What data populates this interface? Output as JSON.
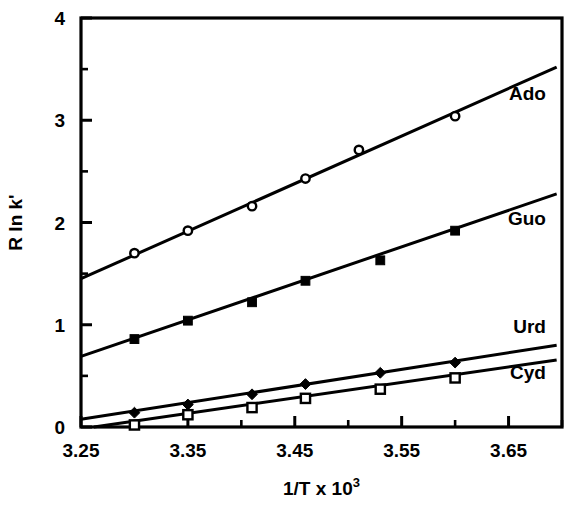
{
  "chart_data": {
    "type": "scatter",
    "title": "",
    "subtitle": "",
    "xlabel": "1/T x 10",
    "xlabel_exponent": "3",
    "ylabel": "R ln k'",
    "xlim": [
      3.25,
      3.7
    ],
    "ylim": [
      0,
      4
    ],
    "grid": false,
    "legend_position": "inline-right",
    "x_ticks": [
      3.25,
      3.35,
      3.45,
      3.55,
      3.65
    ],
    "x_tick_labels": [
      "3.25",
      "3.35",
      "3.45",
      "3.55",
      "3.65"
    ],
    "x_minor_ticks": [
      3.3,
      3.4,
      3.5,
      3.6,
      3.7
    ],
    "y_ticks": [
      0,
      1,
      2,
      3,
      4
    ],
    "y_tick_labels": [
      "0",
      "1",
      "2",
      "3",
      "4"
    ],
    "y_minor_ticks": [
      0.5,
      1.5,
      2.5,
      3.5
    ],
    "series": [
      {
        "name": "Ado",
        "marker": "open-circle",
        "x": [
          3.3,
          3.35,
          3.41,
          3.46,
          3.51,
          3.6
        ],
        "y": [
          1.7,
          1.92,
          2.16,
          2.43,
          2.71,
          3.04
        ],
        "fit_line": {
          "x0": 3.25,
          "y0": 1.45,
          "x1": 3.695,
          "y1": 3.52
        },
        "label_x": 3.685,
        "label_y": 3.2
      },
      {
        "name": "Guo",
        "marker": "filled-square",
        "x": [
          3.3,
          3.35,
          3.41,
          3.46,
          3.53,
          3.6
        ],
        "y": [
          0.86,
          1.04,
          1.22,
          1.43,
          1.63,
          1.92
        ],
        "fit_line": {
          "x0": 3.25,
          "y0": 0.69,
          "x1": 3.695,
          "y1": 2.28
        },
        "label_x": 3.685,
        "label_y": 1.98
      },
      {
        "name": "Urd",
        "marker": "filled-diamond",
        "x": [
          3.3,
          3.35,
          3.41,
          3.46,
          3.53,
          3.6
        ],
        "y": [
          0.14,
          0.22,
          0.32,
          0.42,
          0.53,
          0.63
        ],
        "fit_line": {
          "x0": 3.25,
          "y0": 0.075,
          "x1": 3.695,
          "y1": 0.8
        },
        "label_x": 3.685,
        "label_y": 0.92
      },
      {
        "name": "Cyd",
        "marker": "open-square",
        "x": [
          3.3,
          3.35,
          3.41,
          3.46,
          3.53,
          3.6
        ],
        "y": [
          0.02,
          0.12,
          0.19,
          0.28,
          0.37,
          0.48
        ],
        "fit_line": {
          "x0": 3.262,
          "y0": 0.0,
          "x1": 3.695,
          "y1": 0.655
        },
        "label_x": 3.685,
        "label_y": 0.47
      }
    ]
  }
}
